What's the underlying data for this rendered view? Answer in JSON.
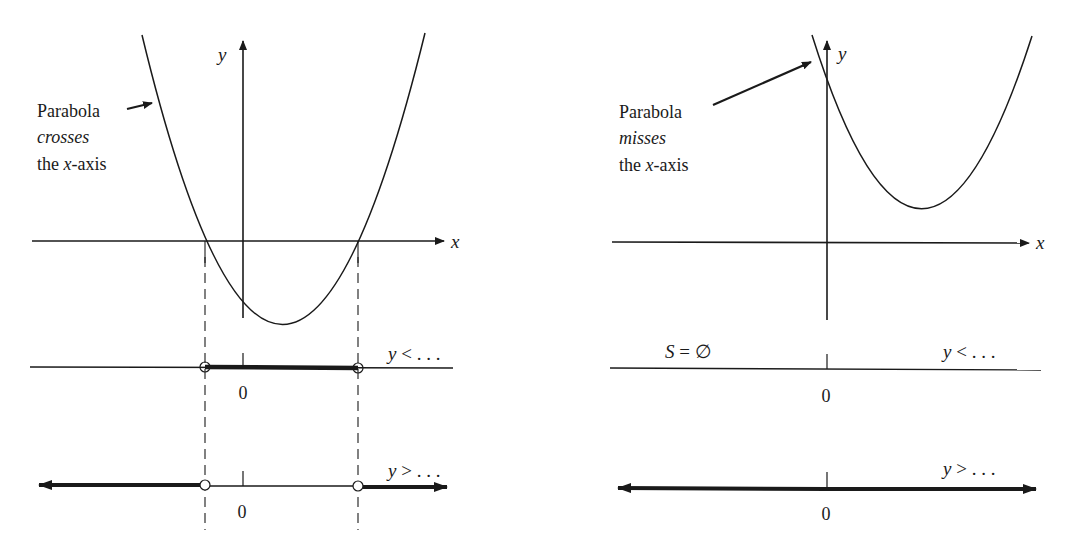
{
  "left_panel": {
    "annotation": {
      "line1": "Parabola",
      "line2": "crosses",
      "line3_pre": "the ",
      "line3_var": "x",
      "line3_post": "-axis"
    },
    "axis_labels": {
      "x": "x",
      "y": "y"
    },
    "less_than": {
      "label_var": "y",
      "label_rest": " < . . .",
      "zero": "0"
    },
    "greater_than": {
      "label_var": "y",
      "label_rest": " > . . .",
      "zero": "0"
    }
  },
  "right_panel": {
    "annotation": {
      "line1": "Parabola",
      "line2": "misses",
      "line3_pre": "the ",
      "line3_var": "x",
      "line3_post": "-axis"
    },
    "axis_labels": {
      "x": "x",
      "y": "y"
    },
    "less_than": {
      "empty_set_var": "S",
      "empty_set_rest": " = ∅",
      "label_var": "y",
      "label_rest": " < . . .",
      "zero": "0"
    },
    "greater_than": {
      "label_var": "y",
      "label_rest": " > . . .",
      "zero": "0"
    }
  },
  "colors": {
    "ink": "#1a1a1a",
    "background": "#ffffff"
  }
}
